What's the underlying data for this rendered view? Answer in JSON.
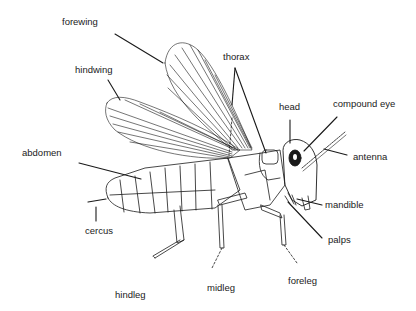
{
  "diagram": {
    "labels": [
      {
        "id": "forewing",
        "text": "forewing",
        "x": 62,
        "y": 17
      },
      {
        "id": "hindwing",
        "text": "hindwing",
        "x": 75,
        "y": 65
      },
      {
        "id": "abdomen",
        "text": "abdomen",
        "x": 22,
        "y": 148
      },
      {
        "id": "cercus",
        "text": "cercus",
        "x": 85,
        "y": 226
      },
      {
        "id": "hindleg",
        "text": "hindleg",
        "x": 115,
        "y": 290
      },
      {
        "id": "midleg",
        "text": "midleg",
        "x": 207,
        "y": 283
      },
      {
        "id": "foreleg",
        "text": "foreleg",
        "x": 288,
        "y": 276
      },
      {
        "id": "palps",
        "text": "palps",
        "x": 328,
        "y": 235
      },
      {
        "id": "mandible",
        "text": "mandible",
        "x": 325,
        "y": 200
      },
      {
        "id": "antenna",
        "text": "antenna",
        "x": 353,
        "y": 152
      },
      {
        "id": "compound_eye",
        "text": "compound eye",
        "x": 333,
        "y": 99
      },
      {
        "id": "head",
        "text": "head",
        "x": 279,
        "y": 102
      },
      {
        "id": "thorax",
        "text": "thorax",
        "x": 223,
        "y": 52
      }
    ],
    "colors": {
      "ink": "#1a1a1a",
      "background": "#ffffff"
    }
  }
}
